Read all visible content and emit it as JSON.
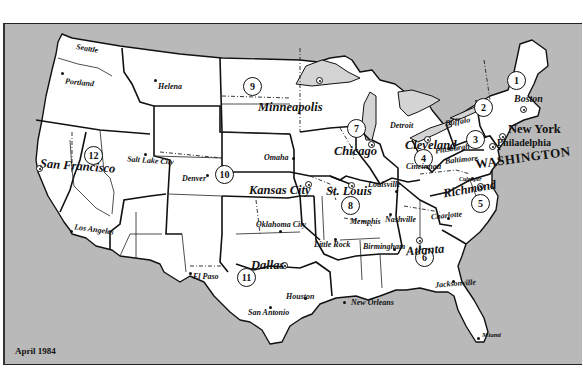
{
  "map": {
    "title": "Federal Reserve Districts",
    "date_label": "April 1984",
    "colors": {
      "ocean": "#b9b9b9",
      "land": "#ffffff",
      "lakes": "#d4d4d4",
      "lines": "#111111"
    },
    "districts": [
      {
        "number": "1",
        "bank_city": "Boston"
      },
      {
        "number": "2",
        "bank_city": "New York"
      },
      {
        "number": "3",
        "bank_city": "Philadelphia"
      },
      {
        "number": "4",
        "bank_city": "Cleveland"
      },
      {
        "number": "5",
        "bank_city": "Richmond"
      },
      {
        "number": "6",
        "bank_city": "Atlanta"
      },
      {
        "number": "7",
        "bank_city": "Chicago"
      },
      {
        "number": "8",
        "bank_city": "St. Louis"
      },
      {
        "number": "9",
        "bank_city": "Minneapolis"
      },
      {
        "number": "10",
        "bank_city": "Kansas City"
      },
      {
        "number": "11",
        "bank_city": "Dallas"
      },
      {
        "number": "12",
        "bank_city": "San Francisco"
      }
    ],
    "capital": "WASHINGTON",
    "branch_cities": [
      "Seattle",
      "Portland",
      "Helena",
      "Salt Lake City",
      "Denver",
      "Los Angeles",
      "Omaha",
      "Oklahoma City",
      "El Paso",
      "Houston",
      "San Antonio",
      "Detroit",
      "Buffalo",
      "Pittsburgh",
      "Cincinnati",
      "Baltimore",
      "Culpeper",
      "Louisville",
      "Memphis",
      "Nashville",
      "Little Rock",
      "Birmingham",
      "Charlotte",
      "Jacksonville",
      "New Orleans",
      "Miami"
    ]
  }
}
